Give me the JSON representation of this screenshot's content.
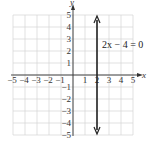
{
  "chart_data": {
    "type": "line",
    "title": "",
    "xlabel": "x",
    "ylabel": "y",
    "xlim": [
      -5,
      5
    ],
    "ylim": [
      -5,
      5
    ],
    "grid": true,
    "x_ticks": [
      "-5",
      "-4",
      "-3",
      "-2",
      "-1",
      "1",
      "2",
      "3",
      "4",
      "5"
    ],
    "y_ticks": [
      "5",
      "4",
      "3",
      "2",
      "1",
      "-1",
      "-2",
      "-3",
      "-4",
      "-5"
    ],
    "series": [
      {
        "name": "2x − 4 = 0",
        "x": [
          2,
          2
        ],
        "y": [
          -5,
          5
        ],
        "arrows": "both"
      }
    ],
    "annotations": [
      {
        "text": "2x − 4 = 0",
        "x": 2.4,
        "y": 2.6
      }
    ],
    "colors": {
      "grid": "#d4d4d4",
      "axis": "#333333",
      "line": "#222222"
    }
  }
}
